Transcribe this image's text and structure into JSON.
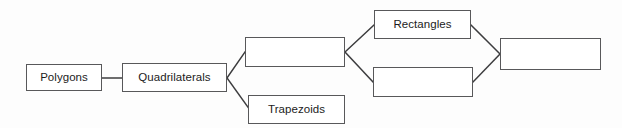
{
  "diagram": {
    "type": "flowchart",
    "background_color": "#fdfdfd",
    "box_border_color": "#58585a",
    "box_fill_color": "#ffffff",
    "text_color": "#1c1c1c",
    "connector_color": "#3c3c3e",
    "nodes": [
      {
        "id": "polygons",
        "label": "Polygons",
        "filled": true,
        "x": 26,
        "y": 64,
        "width": 76,
        "height": 27
      },
      {
        "id": "quadrilaterals",
        "label": "Quadrilaterals",
        "filled": true,
        "x": 122,
        "y": 63,
        "width": 105,
        "height": 29
      },
      {
        "id": "parallelograms-blank",
        "label": "",
        "filled": false,
        "x": 245,
        "y": 37,
        "width": 100,
        "height": 30
      },
      {
        "id": "trapezoids",
        "label": "Trapezoids",
        "filled": true,
        "x": 248,
        "y": 95,
        "width": 97,
        "height": 29
      },
      {
        "id": "rectangles",
        "label": "Rectangles",
        "filled": true,
        "x": 374,
        "y": 10,
        "width": 97,
        "height": 29
      },
      {
        "id": "rhombuses-blank",
        "label": "",
        "filled": false,
        "x": 373,
        "y": 67,
        "width": 100,
        "height": 30
      },
      {
        "id": "squares-blank",
        "label": "",
        "filled": false,
        "x": 500,
        "y": 38,
        "width": 101,
        "height": 32
      }
    ],
    "edges": [
      {
        "id": "polygons-to-quadrilaterals",
        "from": "polygons",
        "to": "quadrilaterals",
        "x1": 102,
        "y1": 78,
        "x2": 122,
        "y2": 78
      },
      {
        "id": "quadrilaterals-to-blank-top",
        "from": "quadrilaterals",
        "to": "parallelograms-blank",
        "x1": 227,
        "y1": 78,
        "x2": 245,
        "y2": 52
      },
      {
        "id": "quadrilaterals-to-trapezoids",
        "from": "quadrilaterals",
        "to": "trapezoids",
        "x1": 227,
        "y1": 78,
        "x2": 250,
        "y2": 110
      },
      {
        "id": "blank-top-to-rectangles",
        "from": "parallelograms-blank",
        "to": "rectangles",
        "x1": 345,
        "y1": 52,
        "x2": 374,
        "y2": 25
      },
      {
        "id": "blank-top-to-blank-bottom",
        "from": "parallelograms-blank",
        "to": "rhombuses-blank",
        "x1": 345,
        "y1": 52,
        "x2": 373,
        "y2": 82
      },
      {
        "id": "rectangles-to-blank-right",
        "from": "rectangles",
        "to": "squares-blank",
        "x1": 471,
        "y1": 25,
        "x2": 500,
        "y2": 54
      },
      {
        "id": "blank-bottom-to-blank-right",
        "from": "rhombuses-blank",
        "to": "squares-blank",
        "x1": 473,
        "y1": 82,
        "x2": 500,
        "y2": 54
      }
    ]
  }
}
